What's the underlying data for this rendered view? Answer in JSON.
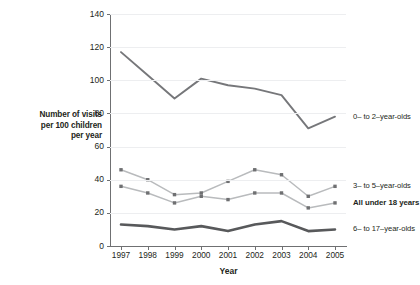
{
  "axis": {
    "y_title_lines": [
      "Number of visits",
      "per 100 children",
      "per year"
    ],
    "x_title": "Year",
    "y_ticks": [
      "0",
      "20",
      "40",
      "60",
      "80",
      "100",
      "120",
      "140"
    ],
    "x_ticks": [
      "1997",
      "1998",
      "1999",
      "2000",
      "2001",
      "2002",
      "2003",
      "2004",
      "2005"
    ]
  },
  "colors": {
    "series_0to2": "#76777a",
    "series_3to5": "#b9bbbd",
    "series_allunder18": "#b9bbbd",
    "series_6to17": "#58595b",
    "gridline": "#edeef0",
    "axis": "#6f7072",
    "text": "#231f20"
  },
  "chart_data": {
    "type": "line",
    "title": "",
    "xlabel": "Year",
    "ylabel": "Number of visits per 100 children per year",
    "x": [
      "1997",
      "1998",
      "1999",
      "2000",
      "2001",
      "2002",
      "2003",
      "2004",
      "2005"
    ],
    "xlim": [
      1997,
      2005
    ],
    "ylim": [
      0,
      140
    ],
    "ytick_step": 20,
    "grid": "horizontal",
    "legend_position": "right-inline",
    "series": [
      {
        "name": "0– to 2–year-olds",
        "color": "#76777a",
        "marker": "none",
        "values": [
          117,
          103,
          89,
          101,
          97,
          95,
          91,
          71,
          78
        ]
      },
      {
        "name": "3– to 5–year-olds",
        "color": "#b9bbbd",
        "marker": "square",
        "values": [
          46,
          40,
          31,
          32,
          39,
          46,
          43,
          30,
          36
        ]
      },
      {
        "name": "All under 18 years",
        "color": "#b9bbbd",
        "marker": "square",
        "bold_label": true,
        "values": [
          36,
          32,
          26,
          30,
          28,
          32,
          32,
          23,
          26
        ]
      },
      {
        "name": "6– to 17–year-olds",
        "color": "#58595b",
        "marker": "none",
        "values": [
          13,
          12,
          10,
          12,
          9,
          13,
          15,
          9,
          10
        ]
      }
    ]
  }
}
